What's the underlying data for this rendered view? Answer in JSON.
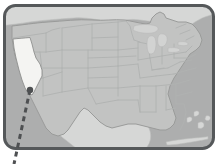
{
  "figure": {
    "name": "us-map-state-locator",
    "width": 218,
    "height": 164,
    "background_color": "#ffffff"
  },
  "frame": {
    "name": "map-frame",
    "shape": "rounded-rectangle",
    "stroke_color": "#55585a",
    "stroke_width": 3,
    "corner_radius": 12,
    "x": 3,
    "y": 4,
    "width": 212,
    "height": 146
  },
  "layers": {
    "ocean_color": "#adaeae",
    "land_other_color": "#d6d7d6",
    "us_fill_color": "#c2c3c2",
    "us_border_color": "#9a9b9a",
    "state_border_color": "#b0b2b1",
    "lake_color": "#d2d3d2",
    "highlight_color": "#f4f4f2",
    "highlight_border_color": "#8e908f"
  },
  "highlight": {
    "name": "highlighted-state",
    "state": "California",
    "fill": "#f4f4f2"
  },
  "pointer": {
    "name": "dashed-pointer-line",
    "color": "#4e5052",
    "stroke_width": 3,
    "dash_pattern": "5 4",
    "dot_radius": 3.2,
    "dot_x": 30,
    "dot_y": 90,
    "end_x": 14,
    "end_y": 164
  },
  "regions": [
    {
      "name": "canada",
      "label": "Canada"
    },
    {
      "name": "mexico",
      "label": "Mexico"
    },
    {
      "name": "united-states",
      "label": "United States"
    },
    {
      "name": "great-lakes",
      "label": "Great Lakes"
    },
    {
      "name": "caribbean-islands",
      "label": "Bahamas / Cuba"
    }
  ]
}
